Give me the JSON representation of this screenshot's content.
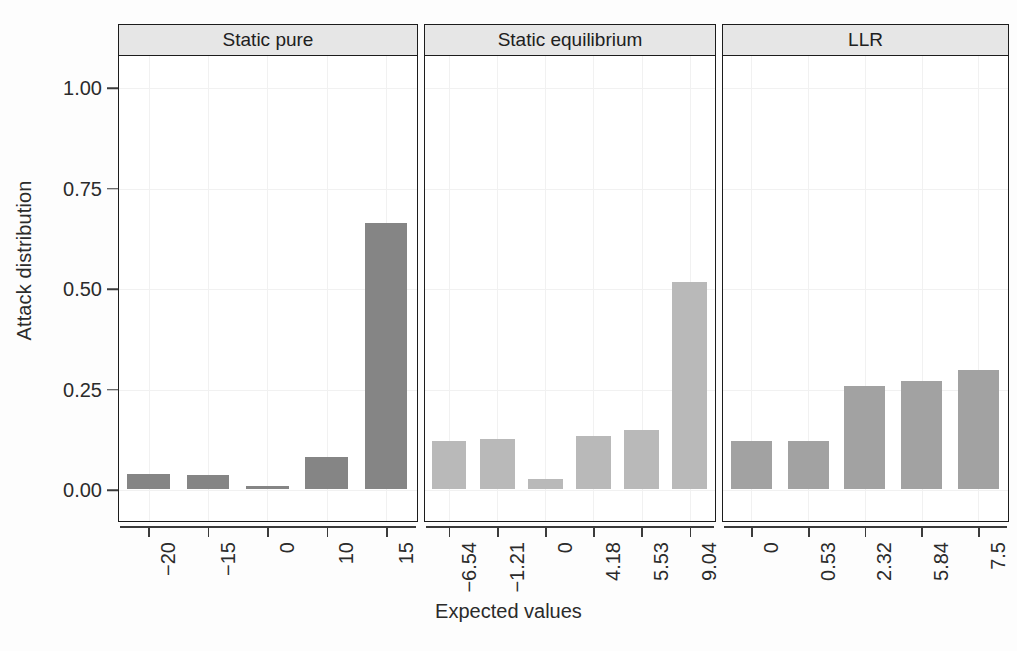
{
  "chart_data": {
    "type": "bar",
    "title": "",
    "xlabel": "Expected values",
    "ylabel": "Attack distribution",
    "ylim": [
      0,
      1.08
    ],
    "yticks": [
      0.0,
      0.25,
      0.5,
      0.75,
      1.0
    ],
    "ytick_labels": [
      "0.00",
      "0.25",
      "0.50",
      "0.75",
      "1.00"
    ],
    "grid": true,
    "legend": "none",
    "facet_layout": "1x3",
    "panels": [
      {
        "label": "Static pure",
        "bar_color": "#858585",
        "categories": [
          "−20",
          "−15",
          "0",
          "10",
          "15"
        ],
        "values": [
          0.037,
          0.034,
          0.006,
          0.08,
          0.662
        ]
      },
      {
        "label": "Static equilibrium",
        "bar_color": "#b9b9b9",
        "categories": [
          "−6.54",
          "−1.21",
          "0",
          "4.18",
          "5.53",
          "9.04"
        ],
        "values": [
          0.12,
          0.125,
          0.024,
          0.131,
          0.146,
          0.516
        ]
      },
      {
        "label": "LLR",
        "bar_color": "#a2a2a2",
        "categories": [
          "0",
          "0.53",
          "2.32",
          "5.84",
          "7.5"
        ],
        "values": [
          0.119,
          0.12,
          0.256,
          0.269,
          0.295
        ]
      }
    ]
  },
  "style": {
    "panel_strip_fill": "#e6e6e6",
    "panel_border": "#1c1c1c",
    "axis_color": "#3b3b3b",
    "grid_color": "#f1f1f1",
    "text_color": "#2b2b2b",
    "background": "#fdfdfd"
  }
}
